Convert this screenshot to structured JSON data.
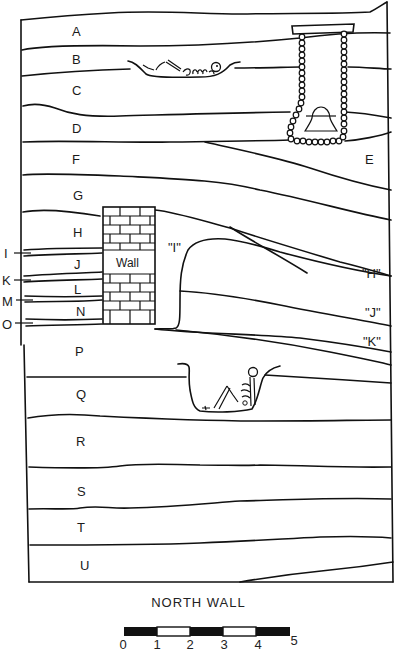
{
  "diagram": {
    "type": "stratigraphic-section",
    "caption": "NORTH WALL",
    "layers_left": [
      {
        "id": "A",
        "x": 77,
        "y": 36
      },
      {
        "id": "B",
        "x": 77,
        "y": 63
      },
      {
        "id": "C",
        "x": 77,
        "y": 94
      },
      {
        "id": "D",
        "x": 77,
        "y": 131
      },
      {
        "id": "F",
        "x": 77,
        "y": 162
      },
      {
        "id": "G",
        "x": 78,
        "y": 199
      },
      {
        "id": "H",
        "x": 78,
        "y": 237
      },
      {
        "id": "J",
        "x": 78,
        "y": 268
      },
      {
        "id": "L",
        "x": 78,
        "y": 293
      },
      {
        "id": "N",
        "x": 80,
        "y": 315
      },
      {
        "id": "P",
        "x": 79,
        "y": 355
      },
      {
        "id": "Q",
        "x": 80,
        "y": 398
      },
      {
        "id": "R",
        "x": 80,
        "y": 445
      },
      {
        "id": "S",
        "x": 81,
        "y": 495
      },
      {
        "id": "T",
        "x": 81,
        "y": 531
      },
      {
        "id": "U",
        "x": 84,
        "y": 569
      }
    ],
    "layers_right": [
      {
        "id": "E",
        "x": 368,
        "y": 163
      },
      {
        "id": "\"I\"",
        "x": 178,
        "y": 252
      },
      {
        "id": "\"H\"",
        "x": 370,
        "y": 276
      },
      {
        "id": "\"J\"",
        "x": 371,
        "y": 315
      },
      {
        "id": "\"K\"",
        "x": 372,
        "y": 345
      }
    ],
    "thin_lenses": [
      {
        "id": "I",
        "y": 254
      },
      {
        "id": "K",
        "y": 280
      },
      {
        "id": "M",
        "y": 300
      },
      {
        "id": "O",
        "y": 323
      }
    ],
    "features": [
      {
        "name": "wall",
        "label": "Wall"
      },
      {
        "name": "burial-extended",
        "layer": "B"
      },
      {
        "name": "burial-flexed",
        "layer": "Q"
      },
      {
        "name": "beaded-ornament-with-bell"
      }
    ],
    "scale_bar": {
      "ticks": [
        "0",
        "1",
        "2",
        "3",
        "4",
        "5"
      ],
      "segments": [
        "black",
        "white",
        "black",
        "white",
        "black"
      ]
    }
  }
}
